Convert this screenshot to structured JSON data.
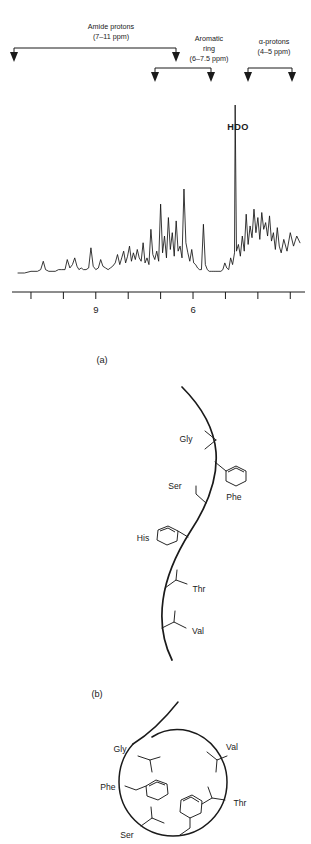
{
  "figure": {
    "panels": [
      {
        "id": "panel-a",
        "label": "(a)"
      },
      {
        "id": "panel-b",
        "label": "(b)"
      }
    ]
  },
  "spectrum": {
    "annotations": [
      {
        "name": "amide-protons",
        "title": "Amide protons",
        "range": "(7–11 ppm)",
        "arrow_ppm": [
          11.0,
          7.0
        ]
      },
      {
        "name": "aromatic-ring",
        "title_line1": "Aromatic",
        "title_line2": "ring",
        "range": "(6–7.5 ppm)",
        "arrow_ppm": [
          7.5,
          6.0
        ]
      },
      {
        "name": "alpha-protons",
        "title": "α-protons",
        "range": "(4–5 ppm)",
        "arrow_ppm": [
          5.0,
          4.0
        ]
      }
    ],
    "peak_labels": [
      {
        "name": "hdo-peak-label",
        "text": "HDO",
        "ppm": 4.7
      }
    ]
  },
  "chart_data": {
    "type": "line",
    "title": "",
    "xlabel": "",
    "ylabel": "",
    "axis_direction": "reversed",
    "xlim": [
      11.4,
      2.7
    ],
    "ylim": [
      0,
      1
    ],
    "grid": false,
    "legend": false,
    "tick_values": [
      11,
      10,
      9,
      8,
      7,
      6,
      5,
      4,
      3
    ],
    "tick_labels": [
      "",
      "",
      "9",
      "",
      "",
      "6",
      "",
      "",
      ""
    ],
    "labeled_ticks": [
      {
        "value": 9,
        "label": "9"
      },
      {
        "value": 6,
        "label": "6"
      }
    ],
    "series": [
      {
        "name": "1H NMR spectrum",
        "x": [
          11.4,
          11.2,
          11.0,
          10.8,
          10.7,
          10.62,
          10.55,
          10.45,
          10.35,
          10.25,
          10.15,
          10.05,
          9.95,
          9.88,
          9.8,
          9.72,
          9.65,
          9.58,
          9.52,
          9.45,
          9.38,
          9.3,
          9.22,
          9.15,
          9.08,
          9.0,
          8.92,
          8.85,
          8.78,
          8.7,
          8.62,
          8.55,
          8.48,
          8.4,
          8.33,
          8.26,
          8.2,
          8.14,
          8.08,
          8.02,
          7.96,
          7.9,
          7.84,
          7.78,
          7.72,
          7.66,
          7.6,
          7.54,
          7.48,
          7.42,
          7.36,
          7.3,
          7.24,
          7.18,
          7.12,
          7.06,
          7.0,
          6.94,
          6.88,
          6.82,
          6.76,
          6.7,
          6.64,
          6.58,
          6.52,
          6.46,
          6.4,
          6.34,
          6.28,
          6.22,
          6.16,
          6.1,
          6.04,
          5.98,
          5.92,
          5.86,
          5.8,
          5.74,
          5.68,
          5.62,
          5.56,
          5.5,
          5.44,
          5.38,
          5.32,
          5.26,
          5.2,
          5.14,
          5.08,
          5.02,
          4.96,
          4.9,
          4.84,
          4.78,
          4.72,
          4.7,
          4.66,
          4.6,
          4.54,
          4.48,
          4.42,
          4.36,
          4.3,
          4.24,
          4.18,
          4.12,
          4.06,
          4.0,
          3.94,
          3.88,
          3.82,
          3.76,
          3.7,
          3.64,
          3.58,
          3.52,
          3.46,
          3.4,
          3.34,
          3.28,
          3.2,
          3.1,
          3.0,
          2.9,
          2.8,
          2.7
        ],
        "y": [
          0.0,
          0.0,
          0.01,
          0.01,
          0.02,
          0.07,
          0.02,
          0.01,
          0.01,
          0.01,
          0.02,
          0.02,
          0.02,
          0.08,
          0.03,
          0.05,
          0.09,
          0.04,
          0.02,
          0.03,
          0.02,
          0.02,
          0.03,
          0.15,
          0.04,
          0.02,
          0.03,
          0.08,
          0.04,
          0.03,
          0.02,
          0.03,
          0.04,
          0.06,
          0.11,
          0.05,
          0.09,
          0.13,
          0.06,
          0.1,
          0.16,
          0.07,
          0.12,
          0.08,
          0.14,
          0.09,
          0.07,
          0.18,
          0.06,
          0.09,
          0.05,
          0.26,
          0.11,
          0.08,
          0.13,
          0.07,
          0.41,
          0.12,
          0.22,
          0.09,
          0.33,
          0.14,
          0.24,
          0.1,
          0.31,
          0.13,
          0.16,
          0.09,
          0.5,
          0.18,
          0.12,
          0.07,
          0.14,
          0.06,
          0.05,
          0.03,
          0.02,
          0.02,
          0.29,
          0.05,
          0.02,
          0.01,
          0.01,
          0.01,
          0.01,
          0.01,
          0.01,
          0.01,
          0.02,
          0.06,
          0.03,
          0.02,
          0.09,
          0.05,
          0.12,
          1.0,
          0.13,
          0.17,
          0.1,
          0.22,
          0.13,
          0.35,
          0.17,
          0.28,
          0.21,
          0.38,
          0.24,
          0.33,
          0.2,
          0.36,
          0.26,
          0.3,
          0.22,
          0.34,
          0.19,
          0.24,
          0.14,
          0.27,
          0.16,
          0.12,
          0.2,
          0.13,
          0.24,
          0.16,
          0.22,
          0.18
        ]
      }
    ]
  },
  "panel_a": {
    "caption": "(a)",
    "description": "unfolded-extended-polypeptide-chain",
    "residues": [
      {
        "name": "gly",
        "label": "Gly"
      },
      {
        "name": "phe",
        "label": "Phe"
      },
      {
        "name": "ser",
        "label": "Ser"
      },
      {
        "name": "his",
        "label": "His"
      },
      {
        "name": "thr",
        "label": "Thr"
      },
      {
        "name": "val",
        "label": "Val"
      }
    ]
  },
  "panel_b": {
    "caption": "(b)",
    "description": "folded-globular-protein",
    "residues": [
      {
        "name": "gly",
        "label": "Gly"
      },
      {
        "name": "val",
        "label": "Val"
      },
      {
        "name": "phe",
        "label": "Phe"
      },
      {
        "name": "thr",
        "label": "Thr"
      },
      {
        "name": "ser",
        "label": "Ser"
      }
    ]
  },
  "colors": {
    "ink": "#1a1a1a",
    "trace": "#151515",
    "background": "#ffffff"
  }
}
